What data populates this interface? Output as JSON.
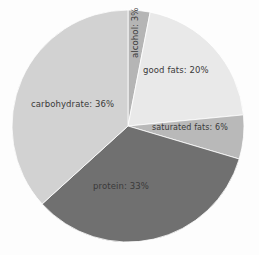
{
  "chart_data": {
    "type": "pie",
    "title": "",
    "subtitle": "",
    "xlabel": "",
    "ylabel": "",
    "legend_position": "none",
    "grid": false,
    "labels_on_slices": true,
    "start_angle_deg": 0,
    "direction": "clockwise",
    "categories": [
      "alcohol",
      "good fats",
      "saturated fats",
      "protein",
      "carbohydrate"
    ],
    "values": [
      3,
      20,
      6,
      33,
      36
    ],
    "unit": "%",
    "slices": [
      {
        "name": "alcohol",
        "value": 3,
        "label": "alcohol: 3%",
        "color": "#b5b5b5",
        "orientation": "vertical"
      },
      {
        "name": "good fats",
        "value": 20,
        "label": "good fats: 20%",
        "color": "#e9e9e9",
        "orientation": "horizontal"
      },
      {
        "name": "saturated fats",
        "value": 6,
        "label": "saturated fats: 6%",
        "color": "#b9b9b9",
        "orientation": "horizontal"
      },
      {
        "name": "protein",
        "value": 33,
        "label": "protein: 33%",
        "color": "#707070",
        "orientation": "horizontal"
      },
      {
        "name": "carbohydrate",
        "value": 36,
        "label": "carbohydrate: 36%",
        "color": "#d2d2d2",
        "orientation": "horizontal"
      }
    ],
    "geometry": {
      "center_x": 128,
      "center_y": 126,
      "radius": 116
    },
    "background_color": "#fdfdfd",
    "label_text_color": "#3a3a3a"
  }
}
